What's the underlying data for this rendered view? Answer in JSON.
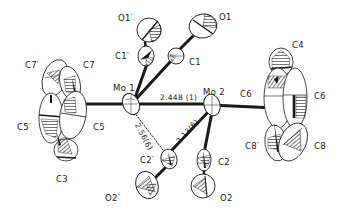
{
  "diagram": {
    "type": "ORTEP thermal ellipsoid molecular structure",
    "colors": {
      "ink": "#1a1a1a",
      "background": "#ffffff"
    },
    "atoms": [
      {
        "id": "Mo1",
        "label": "Mo 1"
      },
      {
        "id": "Mo2",
        "label": "Mo 2"
      },
      {
        "id": "C1",
        "label": "C1"
      },
      {
        "id": "C1p",
        "label": "C1′"
      },
      {
        "id": "O1",
        "label": "O1"
      },
      {
        "id": "O1p",
        "label": "O1′"
      },
      {
        "id": "C2",
        "label": "C2"
      },
      {
        "id": "C2p",
        "label": "C2′"
      },
      {
        "id": "O2",
        "label": "O2"
      },
      {
        "id": "O2p",
        "label": "O2′"
      },
      {
        "id": "C3",
        "label": "C3"
      },
      {
        "id": "C4",
        "label": "C4"
      },
      {
        "id": "C5",
        "label": "C5"
      },
      {
        "id": "C5p",
        "label": "C5′"
      },
      {
        "id": "C6",
        "label": "C6"
      },
      {
        "id": "C6p",
        "label": "C6′"
      },
      {
        "id": "C7",
        "label": "C7"
      },
      {
        "id": "C7p",
        "label": "C7′"
      },
      {
        "id": "C8",
        "label": "C8"
      },
      {
        "id": "C8p",
        "label": "C8′"
      }
    ],
    "bond_distances": [
      {
        "between": [
          "Mo1",
          "Mo2"
        ],
        "label": "2.448 (1)"
      },
      {
        "between": [
          "Mo1",
          "C2p"
        ],
        "label": "2.56(6)"
      },
      {
        "between": [
          "Mo2",
          "C2p"
        ],
        "label": "2.13(6)"
      }
    ]
  }
}
